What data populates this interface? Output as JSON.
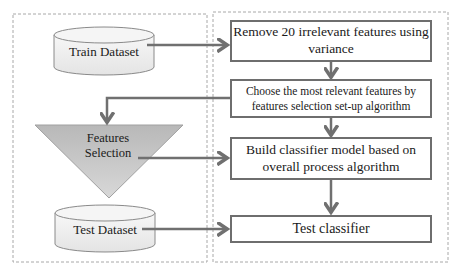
{
  "diagram": {
    "colors": {
      "arrow": "#707070",
      "box_border": "#6e6e6e",
      "panel_border": "#a8a8a8",
      "cylinder_fill": "#f2f2f2",
      "cylinder_stroke": "#8a8a8a",
      "triangle_fill": "#c4c4c4"
    },
    "left_panel": {
      "train_dataset": {
        "label": "Train Dataset",
        "shape": "cylinder"
      },
      "features_selection": {
        "line1": "Features",
        "line2": "Selection",
        "shape": "inverted-triangle"
      },
      "test_dataset": {
        "label": "Test Dataset",
        "shape": "cylinder"
      }
    },
    "right_panel": {
      "steps": [
        {
          "line1": "Remove 20 irrelevant features using",
          "line2": "variance"
        },
        {
          "line1": "Choose the most relevant features by",
          "line2": "features selection set-up algorithm"
        },
        {
          "line1": "Build classifier model based on",
          "line2": "overall process algorithm"
        },
        {
          "line1": "Test classifier"
        }
      ]
    }
  }
}
